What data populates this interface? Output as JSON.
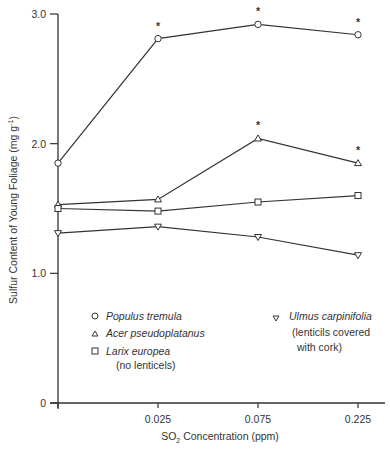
{
  "chart_data": {
    "type": "line",
    "title": "",
    "xlabel": "SO2 Concentration (ppm)",
    "ylabel": "Sulfur Content of Young Foliage (mg g-1)",
    "categories": [
      "0",
      "0.025",
      "0.075",
      "0.225"
    ],
    "x_tick_labels": [
      "",
      "0.025",
      "0.075",
      "0.225"
    ],
    "y_ticks": [
      0,
      1.0,
      2.0,
      3.0
    ],
    "y_tick_labels": [
      "0",
      "1.0",
      "2.0",
      "3.0"
    ],
    "ylim": [
      0,
      3.0
    ],
    "grid": false,
    "series": [
      {
        "name": "Populus tremula",
        "marker": "circle",
        "values": [
          1.85,
          2.81,
          2.92,
          2.84
        ],
        "significant": [
          false,
          true,
          true,
          true
        ]
      },
      {
        "name": "Acer pseudoplatanus",
        "marker": "triangle-up",
        "values": [
          1.53,
          1.57,
          2.04,
          1.85
        ],
        "significant": [
          false,
          false,
          true,
          true
        ]
      },
      {
        "name": "Larix europea",
        "note": "(no lenticels)",
        "marker": "square",
        "values": [
          1.5,
          1.48,
          1.55,
          1.6
        ],
        "significant": [
          false,
          false,
          false,
          false
        ]
      },
      {
        "name": "Ulmus carpinifolia",
        "note": "(lenticils covered with cork)",
        "marker": "triangle-down",
        "values": [
          1.31,
          1.36,
          1.28,
          1.14
        ],
        "significant": [
          false,
          false,
          false,
          false
        ]
      }
    ],
    "annotations": [
      "* significant difference"
    ]
  },
  "legend": {
    "populus": "Populus tremula",
    "acer": "Acer pseudoplatanus",
    "larix": "Larix europea",
    "larix_note": "(no lenticels)",
    "ulmus": "Ulmus carpinifolia",
    "ulmus_note1": "(lenticils covered",
    "ulmus_note2": "with cork)"
  },
  "axes": {
    "y_label_main": "Sulfur Content of Young Foliage (mg g",
    "y_label_sup": "-1",
    "x_label_pre": "SO",
    "x_label_sub": "2",
    "x_label_post": " Concentration (ppm)",
    "star": "*"
  }
}
